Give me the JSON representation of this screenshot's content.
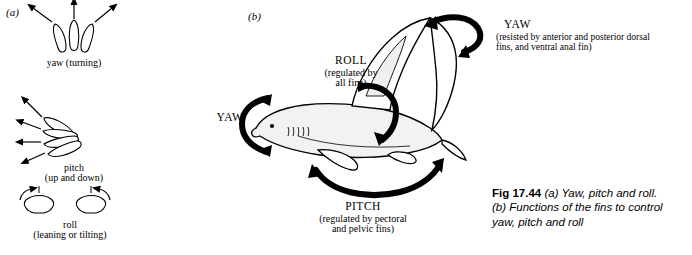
{
  "panels": {
    "a_tag": "(a)",
    "b_tag": "(b)"
  },
  "panel_a": {
    "items": [
      {
        "name": "yaw",
        "title": "yaw (turning)",
        "line1": "yaw (turning)",
        "line2": ""
      },
      {
        "name": "pitch",
        "title": "pitch (up and down)",
        "line1": "pitch",
        "line2": "(up and down)"
      },
      {
        "name": "roll",
        "title": "roll (leaning or tilting)",
        "line1": "roll",
        "line2": "(leaning or tilting)"
      }
    ]
  },
  "panel_b": {
    "labels": [
      {
        "id": "roll",
        "heading": "ROLL",
        "line1": "(regulated by",
        "line2": "all fins)"
      },
      {
        "id": "yaw-left",
        "heading": "YAW",
        "line1": "",
        "line2": ""
      },
      {
        "id": "yaw-right",
        "heading": "YAW",
        "line1": "(resisted by anterior and posterior dorsal",
        "line2": "fins, and ventral anal fin)"
      },
      {
        "id": "pitch",
        "heading": "PITCH",
        "line1": "(regulated by pectoral",
        "line2": "and pelvic fins)"
      }
    ]
  },
  "caption": {
    "figure_number": "Fig 17.44",
    "part_a": "(a) Yaw, pitch and roll.",
    "part_b_line1": "(b) Functions of the fins to control",
    "part_b_line2": "yaw, pitch and roll"
  },
  "colors": {
    "ink": "#000000",
    "background": "#ffffff",
    "fill_light": "#f2f2f2"
  }
}
